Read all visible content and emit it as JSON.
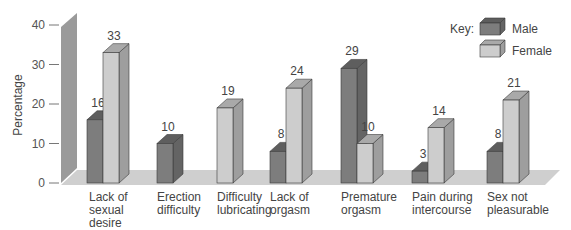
{
  "chart_data": {
    "type": "bar",
    "title": "",
    "xlabel": "",
    "ylabel": "Percentage",
    "ylim": [
      0,
      40
    ],
    "yticks": [
      0,
      10,
      20,
      30,
      40
    ],
    "grid": false,
    "style": "3d",
    "legend": {
      "title": "Key:",
      "position": "top-right",
      "entries": [
        "Male",
        "Female"
      ]
    },
    "categories": [
      "Lack of sexual desire",
      "Erection difficulty",
      "Difficulty lubricating",
      "Lack of orgasm",
      "Premature orgasm",
      "Pain during intercourse",
      "Sex not pleasurable"
    ],
    "category_lines": [
      [
        "Lack of",
        "sexual",
        "desire"
      ],
      [
        "Erection",
        "difficulty"
      ],
      [
        "Difficulty",
        "lubricating"
      ],
      [
        "Lack of",
        "orgasm"
      ],
      [
        "Premature",
        "orgasm"
      ],
      [
        "Pain during",
        "intercourse"
      ],
      [
        "Sex not",
        "pleasurable"
      ]
    ],
    "series": [
      {
        "name": "Male",
        "values": [
          16,
          10,
          null,
          8,
          29,
          3,
          8
        ]
      },
      {
        "name": "Female",
        "values": [
          33,
          null,
          19,
          24,
          10,
          14,
          21
        ]
      }
    ]
  },
  "colors": {
    "male_front": "#7d7d7d",
    "male_top": "#5e5e5e",
    "male_side": "#646464",
    "female_front": "#cdcdcd",
    "female_top": "#a9a9a9",
    "female_side": "#9e9e9e",
    "wall": "#9a9a9a",
    "floor": "#cfcfcf",
    "axis": "#777777"
  }
}
